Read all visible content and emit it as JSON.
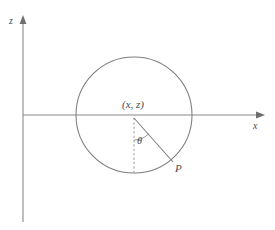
{
  "figure": {
    "background_color": "#ffffff",
    "line_color": "#7d7d7d",
    "axis_color": "#8a8a8a",
    "text_color": "#4a4a4a",
    "width": 275,
    "height": 230
  },
  "axes": {
    "vertical": {
      "label": "z",
      "icon": "arrow-up-icon",
      "x": 23,
      "top_y": 18,
      "bottom_y": 222
    },
    "horizontal": {
      "label": "x",
      "icon": "arrow-right-icon",
      "y": 115,
      "left_x": 23,
      "right_x": 262
    },
    "origin": {
      "x": 23,
      "y": 115
    }
  },
  "circle": {
    "center": {
      "x": 134,
      "y": 115
    },
    "radius": 58,
    "left_x": 76,
    "right_x": 192,
    "top_y": 57,
    "bottom_y": 173
  },
  "labels": {
    "center_point": "(x, z)",
    "angle": "θ",
    "point_p": "P",
    "axis_z": "z",
    "axis_x": "x"
  },
  "geometry": {
    "dashed_segment": {
      "name": "vertical-dashed-radius",
      "from": {
        "x": 134,
        "y": 117
      },
      "to": {
        "x": 134,
        "y": 173
      }
    },
    "radius_segment": {
      "name": "radius-to-p",
      "from": {
        "x": 134,
        "y": 117
      },
      "to": {
        "x": 173,
        "y": 162
      }
    },
    "angle_arc": {
      "name": "theta-arc",
      "center": {
        "x": 134,
        "y": 117
      },
      "radius": 22,
      "start_angle_deg": 270,
      "end_angle_deg": 311
    }
  }
}
